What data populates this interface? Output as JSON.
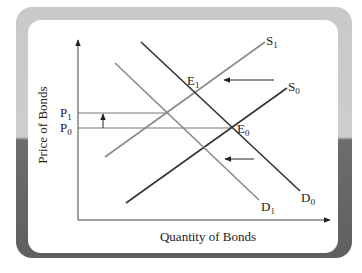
{
  "diagram": {
    "type": "supply-demand",
    "axes": {
      "x_label": "Quantity of Bonds",
      "y_label": "Price of Bonds"
    },
    "price_levels": [
      {
        "id": "P1",
        "base": "P",
        "sub": "1"
      },
      {
        "id": "P0",
        "base": "P",
        "sub": "0"
      }
    ],
    "curves": [
      {
        "id": "S1",
        "base": "S",
        "sub": "1",
        "kind": "supply",
        "shade": "light"
      },
      {
        "id": "S0",
        "base": "S",
        "sub": "0",
        "kind": "supply",
        "shade": "dark"
      },
      {
        "id": "D1",
        "base": "D",
        "sub": "1",
        "kind": "demand",
        "shade": "light"
      },
      {
        "id": "D0",
        "base": "D",
        "sub": "0",
        "kind": "demand",
        "shade": "dark"
      }
    ],
    "equilibria": [
      {
        "id": "E1",
        "base": "E",
        "sub": "1"
      },
      {
        "id": "E0",
        "base": "E",
        "sub": "0"
      }
    ],
    "shifts": [
      {
        "name": "supply-shift-left",
        "direction": "left"
      },
      {
        "name": "demand-shift-left",
        "direction": "left"
      },
      {
        "name": "price-rise",
        "direction": "up"
      }
    ],
    "colors": {
      "dark_line": "#333333",
      "light_line": "#8a8a8a",
      "axis": "#444444",
      "frame_top": "#c9c9c9",
      "frame_bottom": "#5f5f5f"
    }
  }
}
